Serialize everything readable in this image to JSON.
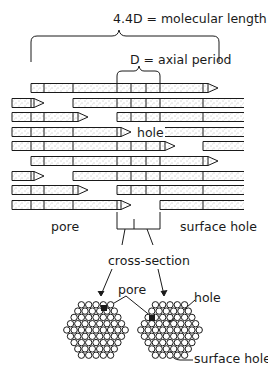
{
  "labels": {
    "molecular_length": "4.4D = molecular length",
    "axial_period": "D = axial period",
    "hole": "hole",
    "pore": "pore",
    "surface_hole": "surface hole",
    "cross_section": "cross-section",
    "pore_bottom": "pore",
    "hole_bottom": "hole",
    "surface_hole_bottom": "surface hole"
  },
  "colors": {
    "ink": "#1a1a1a",
    "fill": "#ffffff",
    "stipple": "#6a6a6a"
  },
  "rows": [
    {
      "y": 88,
      "segments": [
        [
          31,
          218,
          "arrow"
        ]
      ]
    },
    {
      "y": 103,
      "segments": [
        [
          12,
          44,
          "arrow"
        ],
        [
          73,
          244,
          "open"
        ]
      ]
    },
    {
      "y": 117,
      "segments": [
        [
          12,
          88,
          "arrow"
        ],
        [
          117,
          244,
          "open"
        ]
      ]
    },
    {
      "y": 132,
      "segments": [
        [
          12,
          131,
          "arrow"
        ],
        [
          160,
          244,
          "open"
        ]
      ]
    },
    {
      "y": 146,
      "segments": [
        [
          12,
          175,
          "arrow"
        ],
        [
          203,
          244,
          "open"
        ]
      ]
    },
    {
      "y": 161,
      "segments": [
        [
          31,
          218,
          "arrow"
        ]
      ]
    },
    {
      "y": 176,
      "segments": [
        [
          12,
          44,
          "arrow"
        ],
        [
          73,
          244,
          "open"
        ]
      ]
    },
    {
      "y": 190,
      "segments": [
        [
          12,
          88,
          "arrow"
        ],
        [
          117,
          244,
          "open"
        ]
      ]
    },
    {
      "y": 205,
      "segments": [
        [
          12,
          131,
          "arrow"
        ],
        [
          160,
          244,
          "open"
        ]
      ]
    }
  ],
  "dividers": [
    31,
    44,
    73,
    117,
    131,
    146,
    160,
    203
  ],
  "cross_sections": [
    {
      "cx": 96,
      "cy": 330,
      "pore": [
        104,
        308
      ]
    },
    {
      "cx": 170,
      "cy": 330,
      "pore": [
        152,
        318
      ],
      "hole": [
        170,
        318
      ]
    }
  ]
}
